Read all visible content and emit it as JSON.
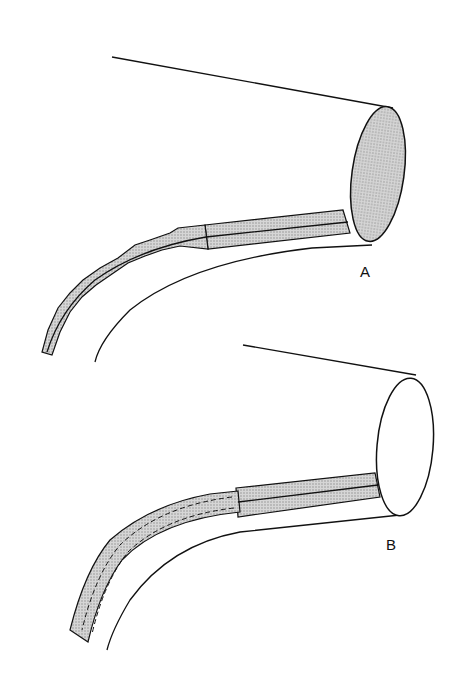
{
  "figure": {
    "panels": [
      {
        "id": "A",
        "label": "A",
        "description": "Tube with segmented (notched) flexible section, solid straight section into ellipse opening (shaded)"
      },
      {
        "id": "B",
        "label": "B",
        "description": "Tube with segmented section with dashed inner outline, straight section into unshaded ellipse opening"
      }
    ]
  },
  "colors": {
    "line": "#111111",
    "fill": "#c9c9c9",
    "background": "#ffffff"
  }
}
